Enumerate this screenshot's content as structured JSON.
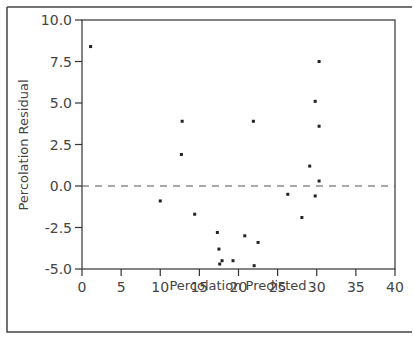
{
  "chart_data": {
    "type": "scatter",
    "title": "",
    "xlabel": "Percolation Predicted",
    "ylabel": "Percolation Residual",
    "xlim": [
      0,
      40
    ],
    "ylim": [
      -5.0,
      10.0
    ],
    "xticks": [
      0,
      5,
      10,
      15,
      20,
      25,
      30,
      35,
      40
    ],
    "xtick_labels": [
      "0",
      "5",
      "10",
      "15",
      "20",
      "25",
      "30",
      "35",
      "40"
    ],
    "yticks": [
      -5.0,
      -2.5,
      0.0,
      2.5,
      5.0,
      7.5,
      10.0
    ],
    "ytick_labels": [
      "-5.0",
      "-2.5",
      "0.0",
      "2.5",
      "5.0",
      "7.5",
      "10.0"
    ],
    "grid": false,
    "reference_line": {
      "y": 0.0,
      "style": "dashed"
    },
    "legend": null,
    "series": [
      {
        "name": "residuals",
        "points": [
          {
            "x": 1.1,
            "y": 8.4
          },
          {
            "x": 10.0,
            "y": -0.9
          },
          {
            "x": 12.7,
            "y": 1.9
          },
          {
            "x": 12.8,
            "y": 3.9
          },
          {
            "x": 14.4,
            "y": -1.7
          },
          {
            "x": 17.3,
            "y": -2.8
          },
          {
            "x": 17.5,
            "y": -3.8
          },
          {
            "x": 17.6,
            "y": -4.7
          },
          {
            "x": 17.9,
            "y": -4.5
          },
          {
            "x": 19.3,
            "y": -4.5
          },
          {
            "x": 20.8,
            "y": -3.0
          },
          {
            "x": 21.9,
            "y": 3.9
          },
          {
            "x": 22.0,
            "y": -4.8
          },
          {
            "x": 22.5,
            "y": -3.4
          },
          {
            "x": 26.3,
            "y": -0.5
          },
          {
            "x": 28.1,
            "y": -1.9
          },
          {
            "x": 29.1,
            "y": 1.2
          },
          {
            "x": 29.8,
            "y": 5.1
          },
          {
            "x": 29.8,
            "y": -0.6
          },
          {
            "x": 30.3,
            "y": 7.5
          },
          {
            "x": 30.3,
            "y": 3.6
          },
          {
            "x": 30.3,
            "y": 0.3
          }
        ]
      }
    ]
  },
  "colors": {
    "point": "#222222",
    "axis": "#333333",
    "frame": "#444444",
    "ref_line": "#555555",
    "background": "#ffffff"
  }
}
